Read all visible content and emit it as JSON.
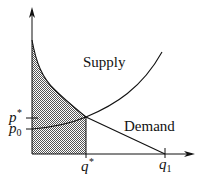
{
  "diagram": {
    "curves": {
      "supply_label": "Supply",
      "demand_label": "Demand"
    },
    "axis_labels": {
      "p_star": "p",
      "p_star_sup": "*",
      "p_zero": "p",
      "p_zero_sub": "0",
      "q_star": "q",
      "q_star_sup": "*",
      "q_one": "q",
      "q_one_sub": "1"
    },
    "colors": {
      "line": "#111111",
      "shade": "#b0b0b0",
      "background": "#ffffff"
    },
    "shaded_region": "area under demand curve from 0 to q*"
  }
}
